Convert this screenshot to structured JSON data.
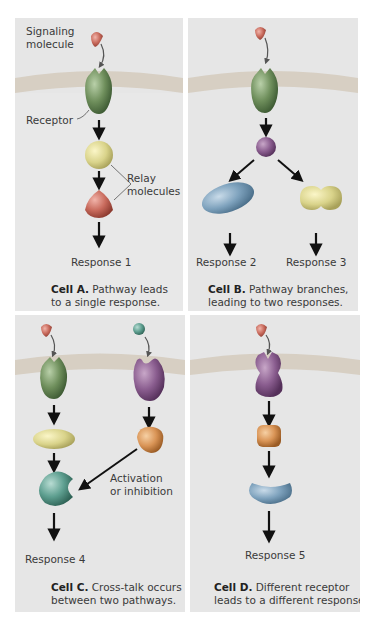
{
  "colors": {
    "panel_bg": "#e6e6e6",
    "membrane": "#d7cfc3",
    "cytoplasm": "#ebebeb",
    "arrow": "#111111"
  },
  "panels": [
    {
      "id": "A",
      "labels": {
        "signaling_molecule_line1": "Signaling",
        "signaling_molecule_line2": "molecule",
        "receptor": "Receptor",
        "relay_line1": "Relay",
        "relay_line2": "molecules",
        "response": "Response 1"
      },
      "caption_bold": "Cell A.",
      "caption_line1": "Pathway leads",
      "caption_line2": "to a single response."
    },
    {
      "id": "B",
      "labels": {
        "response_left": "Response 2",
        "response_right": "Response 3"
      },
      "caption_bold": "Cell B.",
      "caption_line1": "Pathway branches,",
      "caption_line2": "leading to two responses."
    },
    {
      "id": "C",
      "labels": {
        "crosstalk_line1": "Activation",
        "crosstalk_line2": "or inhibition",
        "response": "Response 4"
      },
      "caption_bold": "Cell C.",
      "caption_line1": "Cross-talk occurs",
      "caption_line2": "between two pathways."
    },
    {
      "id": "D",
      "labels": {
        "response": "Response 5"
      },
      "caption_bold": "Cell D.",
      "caption_line1": "Different receptor",
      "caption_line2": "leads to a different response."
    }
  ]
}
